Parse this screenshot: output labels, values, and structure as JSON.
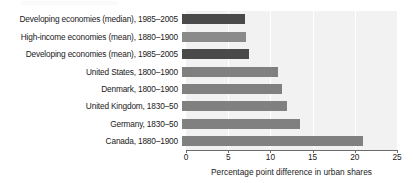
{
  "chart_data": {
    "type": "bar",
    "orientation": "horizontal",
    "title": "",
    "subtitle": "",
    "xlabel": "Percentage point difference in urban shares",
    "ylabel": "",
    "xlim": [
      0,
      25
    ],
    "xticks": [
      0,
      5,
      10,
      15,
      20,
      25
    ],
    "xtick_labels": [
      "0",
      "5",
      "10",
      "15",
      "20",
      "25"
    ],
    "grid": true,
    "grid_axis": "x",
    "legend": false,
    "legend_position": "none",
    "categories": [
      "Developing economies (median), 1985–2005",
      "High-income economies (mean), 1880–1900",
      "Developing economies (mean), 1985–2005",
      "United States, 1800–1900",
      "Denmark, 1800–1900",
      "United Kingdom, 1830–50",
      "Germany, 1830–50",
      "Canada, 1880–1900"
    ],
    "values": [
      7.5,
      7.6,
      7.9,
      11.4,
      11.8,
      12.4,
      14.0,
      21.5
    ],
    "bar_colors": [
      "#4a4a4a",
      "#8a8a8a",
      "#4a4a4a",
      "#808080",
      "#808080",
      "#808080",
      "#808080",
      "#808080"
    ]
  },
  "style": {
    "plot_background": "#f2f2f2",
    "page_background": "#ffffff",
    "gridline_color": "#ffffff",
    "axis_color": "#6b6b6b",
    "text_color": "#1a1a1a",
    "dark_bar_color": "#4a4a4a",
    "light_bar_color": "#808080"
  }
}
